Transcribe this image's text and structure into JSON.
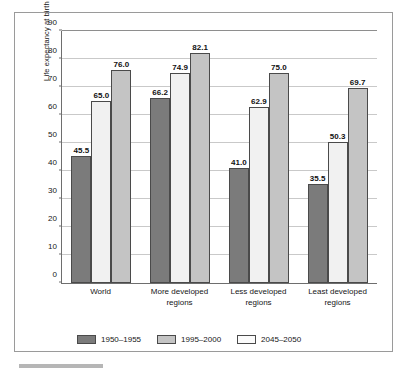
{
  "chart_data": {
    "type": "bar",
    "title": "",
    "xlabel": "",
    "ylabel": "Life expectancy at birth (years)",
    "ylim": [
      0,
      90
    ],
    "ytick_step": 10,
    "yticks": [
      "90",
      "80",
      "70",
      "60",
      "50",
      "40",
      "30",
      "20",
      "10",
      "0"
    ],
    "grid": true,
    "legend_position": "bottom",
    "categories": [
      "World",
      "More developed regions",
      "Less developed regions",
      "Least developed regions"
    ],
    "category_lines": [
      [
        "World"
      ],
      [
        "More developed",
        "regions"
      ],
      [
        "Less developed",
        "regions"
      ],
      [
        "Least developed",
        "regions"
      ]
    ],
    "series": [
      {
        "name": "1950–1955",
        "color": "#7b7b7b",
        "bar_color": "#7b7b7b",
        "values": [
          45.5,
          66.2,
          41.0,
          35.5
        ],
        "labels": [
          "45.5",
          "66.2",
          "41.0",
          "35.5"
        ]
      },
      {
        "name": "1995–2000",
        "color": "#c4c4c4",
        "bar_color": "#f1f1f1",
        "values": [
          65.0,
          74.9,
          62.9,
          50.3
        ],
        "labels": [
          "65.0",
          "74.9",
          "62.9",
          "50.3"
        ]
      },
      {
        "name": "2045–2050",
        "color": "#fbfbfb",
        "bar_color": "#c4c4c4",
        "values": [
          76.0,
          82.1,
          75.0,
          69.7
        ],
        "labels": [
          "76.0",
          "82.1",
          "75.0",
          "69.7"
        ]
      }
    ]
  }
}
